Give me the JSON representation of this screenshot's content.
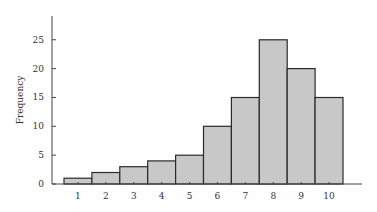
{
  "chart_data": {
    "type": "bar",
    "subtype": "histogram",
    "title": "",
    "xlabel": "",
    "ylabel": "Frequency",
    "categories": [
      "1",
      "2",
      "3",
      "4",
      "5",
      "6",
      "7",
      "8",
      "9",
      "10"
    ],
    "values": [
      1,
      2,
      3,
      4,
      5,
      10,
      15,
      25,
      20,
      15
    ],
    "ylim": [
      0,
      29
    ],
    "yticks": [
      0,
      5,
      10,
      15,
      20,
      25
    ],
    "grid": false,
    "legend": null,
    "bar_color": "#c8c8c8",
    "edge_color": "#2a2a2a"
  }
}
